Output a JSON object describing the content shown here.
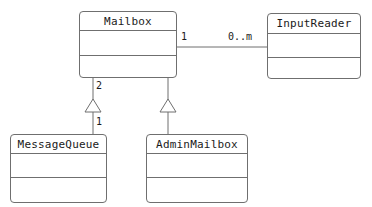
{
  "diagram": {
    "kind": "uml-class-diagram",
    "width": 372,
    "height": 207,
    "background_color": "#ffffff",
    "line_color": "#6f6f6f",
    "text_color": "#1a1a1a"
  },
  "classes": [
    {
      "id": "mailbox",
      "name": "Mailbox",
      "x": 79,
      "y": 11,
      "width": 98,
      "height": 67,
      "name_height": 19,
      "attrs_height": 25
    },
    {
      "id": "inputreader",
      "name": "InputReader",
      "x": 267,
      "y": 13,
      "width": 94,
      "height": 66,
      "name_height": 20,
      "attrs_height": 24
    },
    {
      "id": "messagequeue",
      "name": "MessageQueue",
      "x": 10,
      "y": 134,
      "width": 97,
      "height": 69,
      "name_height": 19,
      "attrs_height": 24
    },
    {
      "id": "adminmailbox",
      "name": "AdminMailbox",
      "x": 146,
      "y": 134,
      "width": 102,
      "height": 69,
      "name_height": 19,
      "attrs_height": 24
    }
  ],
  "relationships": [
    {
      "id": "mailbox-inputreader",
      "type": "association",
      "from": "mailbox",
      "to": "inputreader",
      "source_multiplicity": "1",
      "target_multiplicity": "0..m"
    },
    {
      "id": "messagequeue-mailbox",
      "type": "generalization",
      "from": "messagequeue",
      "to": "mailbox",
      "source_multiplicity": "1",
      "target_multiplicity": "2"
    },
    {
      "id": "adminmailbox-mailbox",
      "type": "generalization",
      "from": "adminmailbox",
      "to": "mailbox",
      "source_multiplicity": "",
      "target_multiplicity": ""
    }
  ],
  "labels": {
    "mailbox_to_inputreader_source": "1",
    "mailbox_to_inputreader_target": "0..m",
    "mailbox_to_messagequeue_top": "2",
    "mailbox_to_messagequeue_bottom": "1"
  }
}
